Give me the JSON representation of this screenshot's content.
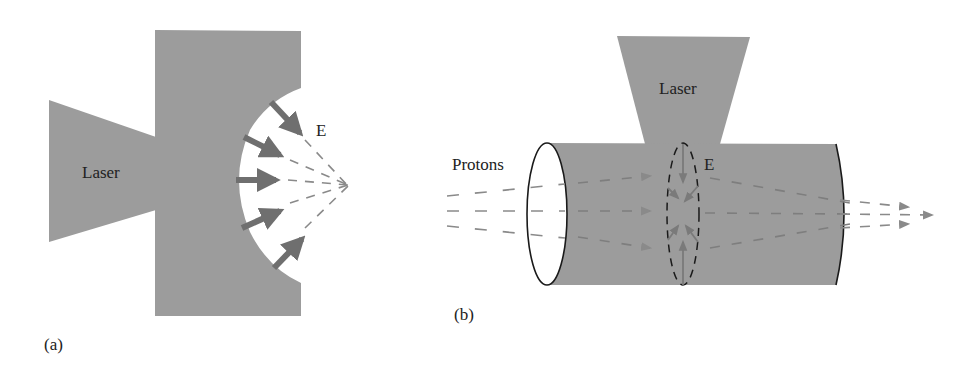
{
  "colors": {
    "fill_gray": "#9c9c9c",
    "arrow_gray": "#6f6f6f",
    "dash_gray": "#8a8a8a",
    "outline": "#1a1a1a",
    "text": "#222222",
    "background": "#ffffff"
  },
  "panel_a": {
    "label": "(a)",
    "laser_label": "Laser",
    "field_label": "E",
    "field_arrow_count": 5,
    "description": "Laser hits a target with concave rear surface; field E arrows focus toward a point"
  },
  "panel_b": {
    "label": "(b)",
    "laser_label": "Laser",
    "field_label": "E",
    "beam_label": "Protons",
    "description": "Laser irradiates a cylinder; radial field E focuses proton beam passing through"
  }
}
